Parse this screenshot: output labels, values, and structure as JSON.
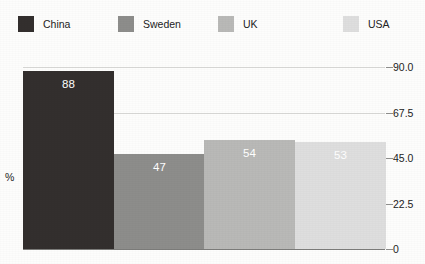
{
  "chart_data": {
    "type": "bar",
    "title": "",
    "subtitle": "",
    "xlabel": "",
    "ylabel": "%",
    "ylim": [
      0,
      90
    ],
    "grid": true,
    "legend_position": "top",
    "y_axis_side": "right",
    "categories": [
      "China",
      "Sweden",
      "UK",
      "USA"
    ],
    "values": [
      88,
      47,
      54,
      53
    ],
    "value_labels": [
      "88",
      "47",
      "54",
      "53"
    ],
    "tick_labels": [
      "90.0",
      "67.5",
      "45.0",
      "22.5",
      "0"
    ],
    "tick_values": [
      90,
      67.5,
      45,
      22.5,
      0
    ],
    "colors": [
      "#332f2e",
      "#8d8d8b",
      "#b9b9b7",
      "#dedede"
    ],
    "legend": [
      {
        "label": "China",
        "color": "#332f2e"
      },
      {
        "label": "Sweden",
        "color": "#8d8d8b"
      },
      {
        "label": "UK",
        "color": "#b9b9b7"
      },
      {
        "label": "USA",
        "color": "#dedede"
      }
    ]
  },
  "legend_layout": {
    "x_positions": [
      18,
      118,
      218,
      343
    ]
  },
  "axis": {
    "percent_symbol": "%"
  }
}
